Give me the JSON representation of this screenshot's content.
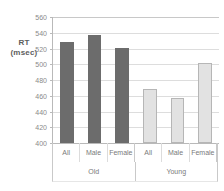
{
  "chart_data": {
    "type": "bar",
    "title": "",
    "xlabel": "",
    "ylabel": "RT (msec)",
    "ylabel_lines": [
      "RT",
      "(msec)"
    ],
    "ylim": [
      400,
      560
    ],
    "ytick_step": 20,
    "yticks": [
      560,
      540,
      520,
      500,
      480,
      460,
      440,
      420,
      400
    ],
    "grid": true,
    "legend": "none",
    "categories": [
      "All",
      "Male",
      "Female",
      "All",
      "Male",
      "Female"
    ],
    "groups": [
      {
        "label": "Old",
        "span": 3,
        "color": "#6c6c6c"
      },
      {
        "label": "Young",
        "span": 3,
        "color": "#e2e2e2"
      }
    ],
    "values": [
      528,
      537,
      521,
      468,
      457,
      502
    ],
    "bars": [
      {
        "group": "Old",
        "category": "All",
        "value": 528,
        "style": "dark"
      },
      {
        "group": "Old",
        "category": "Male",
        "value": 537,
        "style": "dark"
      },
      {
        "group": "Old",
        "category": "Female",
        "value": 521,
        "style": "dark"
      },
      {
        "group": "Young",
        "category": "All",
        "value": 468,
        "style": "light"
      },
      {
        "group": "Young",
        "category": "Male",
        "value": 457,
        "style": "light"
      },
      {
        "group": "Young",
        "category": "Female",
        "value": 502,
        "style": "light"
      }
    ],
    "colors": {
      "old_bar": "#6c6c6c",
      "young_bar": "#e2e2e2",
      "young_bar_border": "#b6b6b6",
      "gridline": "#dddddd",
      "axis": "#b9b9b9",
      "text": "#7a7a7a"
    }
  },
  "caption": ""
}
